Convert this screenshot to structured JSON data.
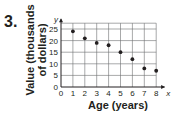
{
  "problem_number": "3.",
  "chart_data": {
    "type": "scatter",
    "title": "",
    "xlabel": "Age (years)",
    "ylabel": "Value (thousands of dollars)",
    "x_axis_letter": "x",
    "y_axis_letter": "y",
    "x": [
      1,
      2,
      3,
      4,
      5,
      6,
      7,
      8
    ],
    "y": [
      24,
      21,
      19,
      18,
      15,
      12,
      8,
      7
    ],
    "xlim": [
      0,
      8
    ],
    "ylim": [
      0,
      27.5
    ],
    "x_ticks": [
      0,
      1,
      2,
      3,
      4,
      5,
      6,
      7,
      8
    ],
    "y_ticks": [
      0,
      5,
      10,
      15,
      20,
      25
    ],
    "grid": true,
    "legend": null
  },
  "ylabel_line1": "Value (thousands",
  "ylabel_line2": "of dollars)"
}
